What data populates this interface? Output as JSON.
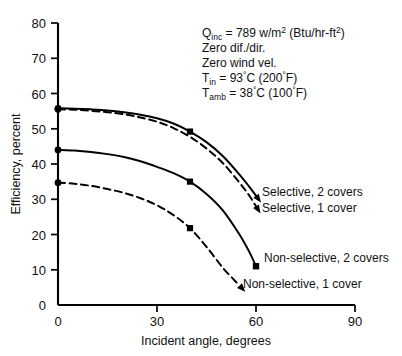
{
  "chart_data": {
    "type": "line",
    "title": "",
    "xlabel": "Incident angle, degrees",
    "ylabel": "Efficiency, percent",
    "xlim": [
      0,
      90
    ],
    "ylim": [
      0,
      80
    ],
    "xticks": [
      0,
      30,
      60,
      90
    ],
    "yticks": [
      0,
      10,
      20,
      30,
      40,
      50,
      60,
      70,
      80
    ],
    "xtick_labels": [
      "0",
      "30",
      "60",
      "90"
    ],
    "ytick_labels": [
      "0",
      "10",
      "20",
      "30",
      "40",
      "50",
      "60",
      "70",
      "80"
    ],
    "grid": false,
    "legend_position": "inline-right-of-curve-ends",
    "series": [
      {
        "name": "Selective, 2 covers",
        "style": "solid",
        "x": [
          0,
          5,
          10,
          15,
          20,
          25,
          30,
          35,
          40,
          45,
          50,
          55,
          58,
          60
        ],
        "values": [
          55.8,
          55.7,
          55.5,
          55.2,
          54.7,
          54.0,
          53.0,
          51.5,
          49.2,
          46.2,
          42.2,
          37.0,
          33.5,
          31.0
        ],
        "markers": [
          {
            "x": 40,
            "y": 49.2
          }
        ]
      },
      {
        "name": "Selective, 1 cover",
        "style": "dashed",
        "x": [
          0,
          5,
          10,
          15,
          20,
          25,
          30,
          35,
          40,
          45,
          50,
          55,
          58,
          60
        ],
        "values": [
          55.5,
          55.4,
          55.1,
          54.7,
          54.1,
          53.2,
          52.0,
          50.2,
          47.7,
          44.4,
          40.2,
          34.7,
          31.0,
          28.0
        ],
        "markers": []
      },
      {
        "name": "Non-selective, 2 covers",
        "style": "solid",
        "x": [
          0,
          5,
          10,
          15,
          20,
          25,
          30,
          35,
          40,
          45,
          50,
          55,
          58,
          60
        ],
        "values": [
          44.0,
          43.8,
          43.4,
          42.8,
          42.0,
          40.8,
          39.2,
          37.4,
          35.0,
          31.5,
          26.8,
          20.0,
          15.0,
          11.0
        ],
        "markers": [
          {
            "x": 40,
            "y": 35.0
          }
        ]
      },
      {
        "name": "Non-selective, 1 cover",
        "style": "dashed",
        "x": [
          0,
          5,
          10,
          15,
          20,
          25,
          30,
          35,
          40,
          45,
          50,
          53,
          55
        ],
        "values": [
          34.7,
          34.4,
          33.8,
          32.9,
          31.8,
          30.3,
          28.3,
          25.5,
          21.8,
          16.5,
          10.5,
          7.5,
          5.5
        ],
        "markers": [
          {
            "x": 40,
            "y": 21.8
          }
        ]
      }
    ],
    "annotations": [
      {
        "id": "q-inc",
        "text": "Q",
        "sub": "inc",
        "rest": " = 789 w/m",
        "sup": "2",
        "tail": "  (Btu/hr-ft",
        "sup2": "2",
        "tail2": ")"
      },
      {
        "id": "zero-dif",
        "text": "Zero dif./dir."
      },
      {
        "id": "zero-wind",
        "text": "Zero wind vel."
      },
      {
        "id": "t-in",
        "text": "T",
        "sub": "in",
        "rest": " = 93",
        "deg": "°",
        "unit": "C (200",
        "deg2": "°",
        "unit2": "F)"
      },
      {
        "id": "t-amb",
        "text": "T",
        "sub": "amb",
        "rest": " = 38",
        "deg": "°",
        "unit": "C (100",
        "deg2": "°",
        "unit2": "F)"
      }
    ]
  },
  "axes": {
    "x_title": "Incident angle, degrees",
    "y_title": "Efficiency, percent",
    "x_ticks": [
      "0",
      "30",
      "60",
      "90"
    ],
    "y_ticks": [
      "80",
      "70",
      "60",
      "50",
      "40",
      "30",
      "20",
      "10",
      "0"
    ]
  },
  "annotation_block": {
    "line1_symbol": "Q",
    "line1_subscript": "inc",
    "line1_a": " = 789 w/m",
    "line1_sup": "2",
    "line1_b": "  (Btu/hr-ft",
    "line1_sup2": "2",
    "line1_c": ")",
    "line2": "Zero dif./dir.",
    "line3": "Zero wind vel.",
    "line4_symbol": "T",
    "line4_subscript": "in",
    "line4_a": " = 93",
    "line4_deg1": "°",
    "line4_b": "C (200",
    "line4_deg2": "°",
    "line4_c": "F)",
    "line5_symbol": "T",
    "line5_subscript": "amb",
    "line5_a": " = 38",
    "line5_deg1": "°",
    "line5_b": "C (100",
    "line5_deg2": "°",
    "line5_c": "F)"
  },
  "curve_labels": {
    "selective_2": "Selective, 2 covers",
    "selective_1": "Selective, 1 cover",
    "nonselective_2": "Non-selective, 2 covers",
    "nonselective_1": "Non-selective, 1 cover"
  },
  "colors": {
    "ink": "#000000",
    "background": "#ffffff"
  }
}
